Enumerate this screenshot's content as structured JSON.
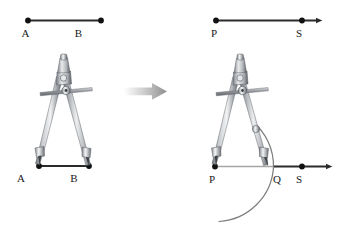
{
  "figure": {
    "title_alt": "Constructing a segment congruent to AB using a compass",
    "background_color": "#ffffff",
    "line_color": "#2b2b2b",
    "ray_color": "#8c8c8c",
    "arc_color": "#7a7a7a",
    "point_color": "#111111",
    "arrow_color": "#b0b0b0",
    "metal_light": "#efefef",
    "metal_mid": "#b9bcc0",
    "metal_dark": "#74787d",
    "metal_shadow": "#4e5257"
  },
  "panels": {
    "left": {
      "name": "given-segment-panel",
      "top_segment": {
        "name": "segment-ab",
        "start_label": "A",
        "end_label": "B",
        "has_arrow": false
      },
      "bottom_segment": {
        "name": "segment-ab-measured",
        "start_label": "A",
        "end_label": "B",
        "has_arrow": false
      },
      "tool": {
        "name": "compass",
        "description": "compass set to width AB"
      },
      "labels": {
        "a_top": "A",
        "b_top": "B",
        "a_bottom": "A",
        "b_bottom": "B"
      }
    },
    "right": {
      "name": "constructed-segment-panel",
      "top_ray": {
        "name": "ray-ps",
        "start_label": "P",
        "mid_label": "S",
        "has_arrow": true
      },
      "bottom_ray": {
        "name": "ray-ps-with-arc",
        "start_label": "P",
        "intersection_label": "Q",
        "end_label": "S",
        "has_arrow": true
      },
      "arc": {
        "name": "compass-arc",
        "description": "arc centered at P passing through Q"
      },
      "tool": {
        "name": "compass",
        "description": "compass pivoting at P drawing arc through Q"
      },
      "labels": {
        "p_top": "P",
        "s_top": "S",
        "p_bottom": "P",
        "q_bottom": "Q",
        "s_bottom": "S"
      }
    }
  },
  "transition": {
    "name": "transition-arrow",
    "glyph": "arrow-right-icon",
    "label": ""
  }
}
